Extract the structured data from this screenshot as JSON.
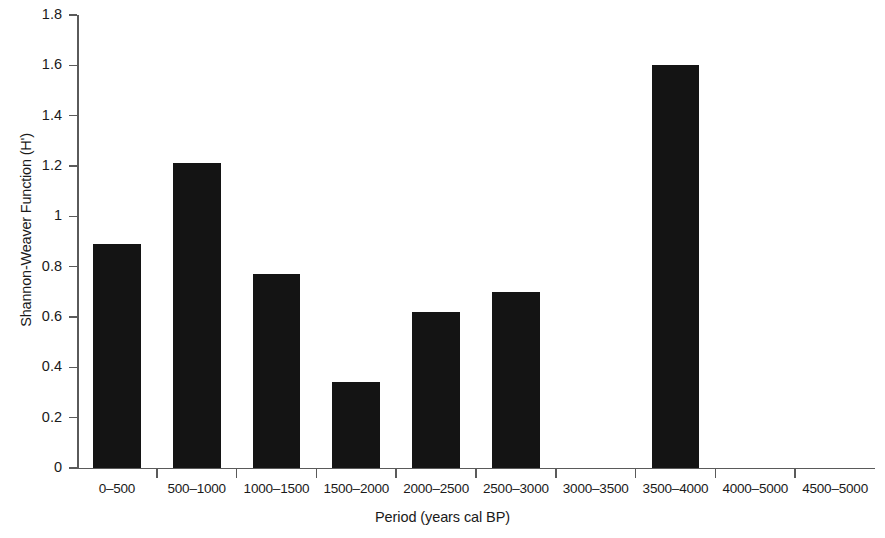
{
  "chart_data": {
    "type": "bar",
    "title": "",
    "xlabel": "Period (years cal BP)",
    "ylabel": "Shannon-Weaver Function (H')",
    "categories": [
      "0–500",
      "500–1000",
      "1000–1500",
      "1500–2000",
      "2000–2500",
      "2500–3000",
      "3000–3500",
      "3500–4000",
      "4000–5000",
      "4500–5000"
    ],
    "values": [
      0.89,
      1.21,
      0.77,
      0.34,
      0.62,
      0.7,
      0,
      1.6,
      0,
      0
    ],
    "ylim": [
      0,
      1.8
    ],
    "ytick_values": [
      0,
      0.2,
      0.4,
      0.6,
      0.8,
      1,
      1.2,
      1.4,
      1.6,
      1.8
    ],
    "ytick_labels": [
      "0",
      "0.2",
      "0.4",
      "0.6",
      "0.8",
      "1",
      "1.2",
      "1.4",
      "1.6",
      "1.8"
    ],
    "grid": false,
    "legend": false,
    "bar_color": "#141414",
    "axis_color": "#5a5a5a",
    "background_color": "#ffffff"
  }
}
